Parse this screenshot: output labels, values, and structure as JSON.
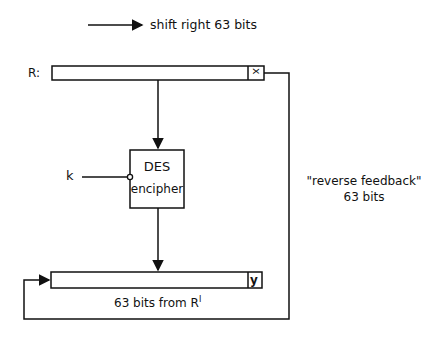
{
  "legend": {
    "arrow_label": "shift right 63 bits"
  },
  "register_r": {
    "label": "R:",
    "cell": "x"
  },
  "des_box": {
    "line1": "DES",
    "line2": "encipher"
  },
  "key": {
    "label": "k"
  },
  "feedback": {
    "line1": "\"reverse feedback\"",
    "line2": "63 bits"
  },
  "register_out": {
    "cell": "y",
    "caption": "63 bits from R",
    "caption_sup": "I"
  },
  "colors": {
    "stroke": "#111111",
    "background": "#ffffff"
  }
}
